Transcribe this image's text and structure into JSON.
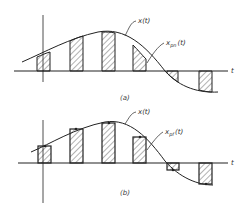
{
  "figure": {
    "panel_a": {
      "caption": "(a)",
      "curve_label": "x(t)",
      "sampled_label_main": "x",
      "sampled_label_sub": "pn",
      "sampled_label_arg": "(t)",
      "axis_label": "t",
      "description": "Natural sampling: pulse tops follow the continuous signal x(t)"
    },
    "panel_b": {
      "caption": "(b)",
      "curve_label": "x(t)",
      "sampled_label_main": "x",
      "sampled_label_sub": "pf",
      "sampled_label_arg": "(t)",
      "axis_label": "t",
      "description": "Flat-top sampling: pulse heights held at sample value"
    },
    "colors": {
      "stroke": "#222222",
      "hatch": "#555555",
      "background": "#ffffff"
    }
  }
}
